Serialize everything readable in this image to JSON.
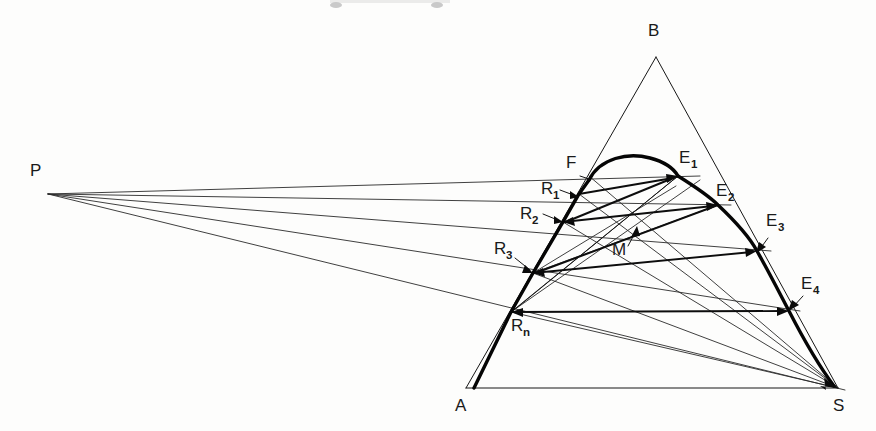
{
  "figure": {
    "type": "geometric-ray-diagram",
    "background_color": "#fdfdfc",
    "ink_color": "#0a0a0a",
    "width": 876,
    "height": 431
  },
  "labels": {
    "P": "P",
    "A": "A",
    "B": "B",
    "S": "S",
    "F": "F",
    "M": "M",
    "R1": "R",
    "R1_sub": "1",
    "R2": "R",
    "R2_sub": "2",
    "R3": "R",
    "R3_sub": "3",
    "Rn": "R",
    "Rn_sub": "n",
    "E1": "E",
    "E1_sub": "1",
    "E2": "E",
    "E2_sub": "2",
    "E3": "E",
    "E3_sub": "3",
    "E4": "E",
    "E4_sub": "4"
  },
  "points": {
    "P": {
      "x": 48,
      "y": 194
    },
    "A": {
      "x": 466,
      "y": 388
    },
    "B": {
      "x": 656,
      "y": 57
    },
    "S": {
      "x": 838,
      "y": 388
    },
    "F": {
      "x": 589,
      "y": 176
    },
    "R1": {
      "x": 579,
      "y": 194
    },
    "R2": {
      "x": 563,
      "y": 222
    },
    "R3": {
      "x": 533,
      "y": 273
    },
    "Rn": {
      "x": 511,
      "y": 312
    },
    "E1": {
      "x": 678,
      "y": 176
    },
    "E2": {
      "x": 718,
      "y": 205
    },
    "E3": {
      "x": 757,
      "y": 251
    },
    "E4": {
      "x": 789,
      "y": 311
    },
    "M": {
      "x": 637,
      "y": 226
    },
    "CurveStart": {
      "x": 474,
      "y": 388
    },
    "CurvePeak": {
      "x": 650,
      "y": 168
    }
  },
  "label_positions": {
    "P": {
      "x": 30,
      "y": 176
    },
    "A": {
      "x": 455,
      "y": 411
    },
    "B": {
      "x": 648,
      "y": 36
    },
    "S": {
      "x": 833,
      "y": 411
    },
    "F": {
      "x": 566,
      "y": 168
    },
    "M": {
      "x": 612,
      "y": 255
    },
    "R1": {
      "x": 541,
      "y": 194
    },
    "R2": {
      "x": 522,
      "y": 219
    },
    "R3": {
      "x": 496,
      "y": 254
    },
    "Rn": {
      "x": 512,
      "y": 331
    },
    "E1": {
      "x": 681,
      "y": 163
    },
    "E2": {
      "x": 718,
      "y": 196
    },
    "E3": {
      "x": 768,
      "y": 226
    },
    "E4": {
      "x": 803,
      "y": 289
    }
  },
  "geometry_notes": {
    "outer_triangle": "A-B-S",
    "apex": "B",
    "base": "A-S",
    "focal_point": "P",
    "thick_curve": "A -> Rn -> R3 -> R2 -> R1 -> F -> peak -> E1 -> E2 -> E3 -> E4 -> S",
    "ray_count_from_P": 5,
    "reflection_pairs": [
      [
        "R1",
        "E1"
      ],
      [
        "R2",
        "E2"
      ],
      [
        "R3",
        "E3"
      ],
      [
        "Rn",
        "E4"
      ]
    ],
    "convergence_point": "M"
  }
}
